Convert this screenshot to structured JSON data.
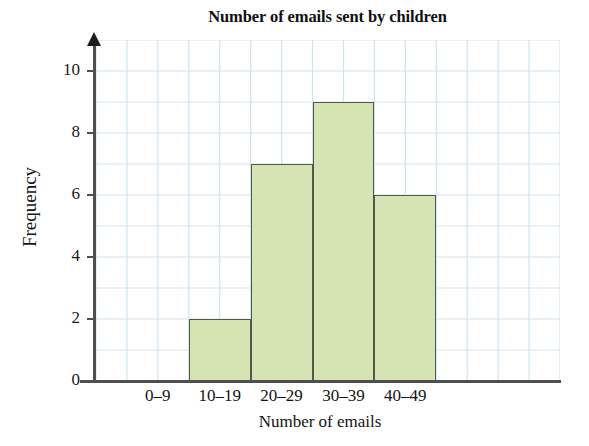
{
  "chart_data": {
    "type": "bar",
    "title": "Number of emails sent by children",
    "xlabel": "Number of emails",
    "ylabel": "Frequency",
    "categories": [
      "0–9",
      "10–19",
      "20–29",
      "30–39",
      "40–49"
    ],
    "values": [
      0,
      2,
      7,
      9,
      6
    ],
    "ylim": [
      0,
      11
    ],
    "y_ticks": [
      0,
      2,
      4,
      6,
      8,
      10
    ],
    "y_tick_labels": [
      "0",
      "2",
      "4",
      "6",
      "8",
      "10"
    ],
    "grid": true,
    "grid_minor_step": 1,
    "legend": null,
    "legend_position": "none",
    "colors": {
      "bar_fill": "#d6e3b2",
      "bar_outline": "#55564a",
      "gridline": "#cfe4f0",
      "axis": "#4f4f4f",
      "text": "#141414",
      "background": "#ffffff"
    }
  }
}
